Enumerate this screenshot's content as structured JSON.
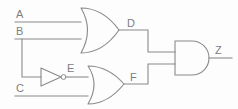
{
  "figure": {
    "type": "logic-circuit-diagram",
    "background_color": "#fdfdfd",
    "line_color": "#8a8a8a",
    "label_color": "#7d7d7d"
  },
  "labels": {
    "input_a": "A",
    "input_b": "B",
    "input_c": "C",
    "node_d": "D",
    "node_e": "E",
    "node_f": "F",
    "output_z": "Z"
  },
  "gates": [
    {
      "id": "or-gate-top",
      "kind": "OR",
      "inputs": [
        "A",
        "B"
      ],
      "output": "D"
    },
    {
      "id": "not-gate",
      "kind": "NOT",
      "inputs": [
        "B"
      ],
      "output": "E"
    },
    {
      "id": "or-gate-bottom",
      "kind": "OR",
      "inputs": [
        "E",
        "C"
      ],
      "output": "F"
    },
    {
      "id": "and-gate",
      "kind": "AND",
      "inputs": [
        "D",
        "F"
      ],
      "output": "Z"
    }
  ],
  "nets": [
    {
      "id": "net-a",
      "from": "A",
      "to": "or-gate-top"
    },
    {
      "id": "net-b",
      "from": "B",
      "to": "or-gate-top"
    },
    {
      "id": "net-b-branch",
      "from": "B",
      "to": "not-gate"
    },
    {
      "id": "net-c",
      "from": "C",
      "to": "or-gate-bottom"
    },
    {
      "id": "net-e",
      "from": "not-gate",
      "to": "or-gate-bottom"
    },
    {
      "id": "net-d",
      "from": "or-gate-top",
      "to": "and-gate"
    },
    {
      "id": "net-f",
      "from": "or-gate-bottom",
      "to": "and-gate"
    },
    {
      "id": "net-z",
      "from": "and-gate",
      "to": "Z"
    }
  ]
}
